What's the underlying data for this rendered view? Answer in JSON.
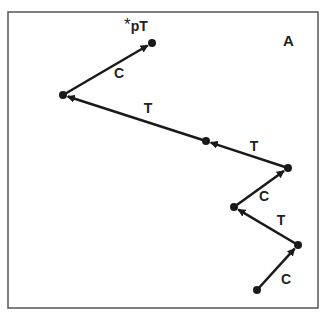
{
  "panel_label": "A",
  "start_label": "*pT",
  "nodes": [
    {
      "id": "n0",
      "x": 257,
      "y": 290
    },
    {
      "id": "n1",
      "x": 298,
      "y": 245
    },
    {
      "id": "n2",
      "x": 234,
      "y": 207
    },
    {
      "id": "n3",
      "x": 288,
      "y": 168
    },
    {
      "id": "n4",
      "x": 206,
      "y": 141
    },
    {
      "id": "n5",
      "x": 63,
      "y": 95
    },
    {
      "id": "n6",
      "x": 152,
      "y": 43
    }
  ],
  "steps": [
    {
      "from": "n0",
      "to": "n1",
      "label": "C"
    },
    {
      "from": "n1",
      "to": "n2",
      "label": "T"
    },
    {
      "from": "n2",
      "to": "n3",
      "label": "C"
    },
    {
      "from": "n3",
      "to": "n4",
      "label": "T"
    },
    {
      "from": "n4",
      "to": "n5",
      "label": "T"
    },
    {
      "from": "n5",
      "to": "n6",
      "label": "C"
    }
  ],
  "colors": {
    "ink": "#1a1a1a",
    "frame": "#555555",
    "background": "#ffffff"
  }
}
